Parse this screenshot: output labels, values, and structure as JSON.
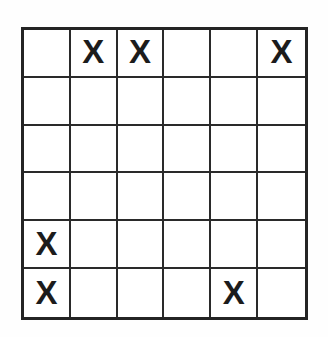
{
  "figure": {
    "kind": "grid-puzzle",
    "rows": 6,
    "columns": 6,
    "mark_symbol": "X",
    "empty_symbol": "",
    "line_color": "#2a2a2a",
    "border_color": "#242424",
    "mark_color": "#1c1c1c",
    "background_color": "#ffffff",
    "page_background_color": "#fdfdfd",
    "cells": [
      [
        "",
        "X",
        "X",
        "",
        "",
        "X"
      ],
      [
        "",
        "",
        "",
        "",
        "",
        ""
      ],
      [
        "",
        "",
        "",
        "",
        "",
        ""
      ],
      [
        "",
        "",
        "",
        "",
        "",
        ""
      ],
      [
        "X",
        "",
        "",
        "",
        "",
        ""
      ],
      [
        "X",
        "",
        "",
        "",
        "X",
        ""
      ]
    ],
    "marked_positions": [
      {
        "row": 1,
        "column": 2
      },
      {
        "row": 1,
        "column": 3
      },
      {
        "row": 1,
        "column": 6
      },
      {
        "row": 5,
        "column": 1
      },
      {
        "row": 6,
        "column": 1
      },
      {
        "row": 6,
        "column": 5
      }
    ],
    "mark_count": 6
  }
}
